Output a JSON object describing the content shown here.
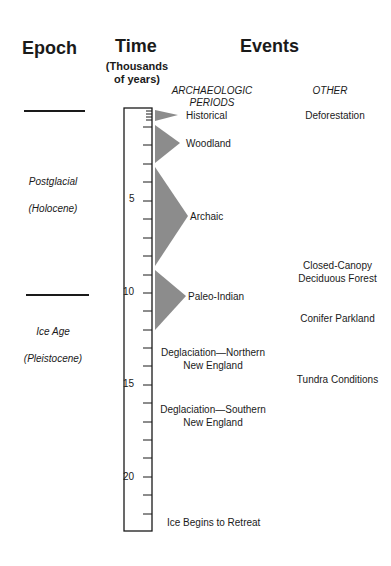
{
  "headers": {
    "epoch": "Epoch",
    "time": "Time",
    "time_sub_1": "(Thousands",
    "time_sub_2": "of years)",
    "events": "Events",
    "archaeologic_1": "ARCHAEOLOGIC",
    "archaeologic_2": "PERIODS",
    "other": "OTHER"
  },
  "epochs": [
    {
      "name": "Postglacial",
      "alt": "(Holocene)"
    },
    {
      "name": "Ice Age",
      "alt": "(Pleistocene)"
    }
  ],
  "scale": {
    "unit": "Thousands of years",
    "min": 0,
    "max": 23,
    "labels": [
      "5",
      "10",
      "15",
      "20"
    ]
  },
  "periods": [
    {
      "label": "Historical",
      "start": 0.1,
      "end": 0.8
    },
    {
      "label": "Woodland",
      "start": 1.0,
      "end": 3.0
    },
    {
      "label": "Archaic",
      "start": 3.2,
      "end": 8.6
    },
    {
      "label": "Paleo-Indian",
      "start": 8.8,
      "end": 12.0
    }
  ],
  "events_archaeologic": [
    {
      "line1": "Deglaciation—Northern",
      "line2": "New England"
    },
    {
      "line1": "Deglaciation—Southern",
      "line2": "New England"
    },
    {
      "line1": "Ice Begins to Retreat"
    }
  ],
  "events_other": [
    {
      "line1": "Deforestation"
    },
    {
      "line1": "Closed-Canopy",
      "line2": "Deciduous Forest"
    },
    {
      "line1": "Conifer Parkland"
    },
    {
      "line1": "Tundra Conditions"
    }
  ],
  "colors": {
    "triangle": "#8c8c8c",
    "line": "#1a1a1a"
  }
}
